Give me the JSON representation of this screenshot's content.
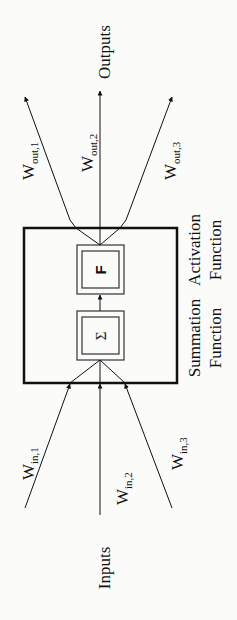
{
  "diagram": {
    "type": "artificial-neuron",
    "orientation": "rotated-90-ccw",
    "labels": {
      "inputs": "Inputs",
      "outputs": "Outputs",
      "summation_line1": "Summation",
      "summation_line2": "Function",
      "activation_line1": "Activation",
      "activation_line2": "Function"
    },
    "weights_in": [
      {
        "base": "W",
        "sub": "in,1"
      },
      {
        "base": "W",
        "sub": "in,2"
      },
      {
        "base": "W",
        "sub": "in,3"
      }
    ],
    "weights_out": [
      {
        "base": "W",
        "sub": "out,1"
      },
      {
        "base": "W",
        "sub": "out,2"
      },
      {
        "base": "W",
        "sub": "out,3"
      }
    ],
    "blocks": {
      "summation_symbol": "Σ",
      "activation_symbol": "F"
    },
    "colors": {
      "line": "#111111",
      "background": "#fbfbf9"
    }
  }
}
